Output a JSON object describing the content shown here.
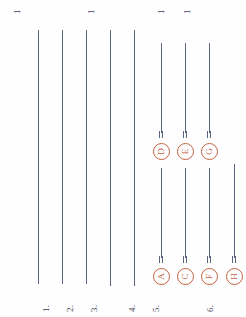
{
  "page": {
    "orientation": "rotated-90-ccw",
    "background_color": "#fefefe",
    "rule_color": "#5a6480",
    "marker_color": "#c1613f",
    "label_color": "#3d4355"
  },
  "top_digits": [
    {
      "text": "1",
      "x": 12,
      "y": 14
    },
    {
      "text": "1",
      "x": 86,
      "y": 14
    },
    {
      "text": "1",
      "x": 156,
      "y": 14
    },
    {
      "text": "1",
      "x": 182,
      "y": 14
    }
  ],
  "rules": [
    {
      "name": "rule-1",
      "x": 38,
      "top": 30,
      "bottom": 284
    },
    {
      "name": "rule-2",
      "x": 62,
      "top": 30,
      "bottom": 284
    },
    {
      "name": "rule-3",
      "x": 86,
      "top": 30,
      "bottom": 284
    },
    {
      "name": "rule-4",
      "x": 110,
      "top": 30,
      "bottom": 286
    },
    {
      "name": "rule-5",
      "x": 134,
      "top": 30,
      "bottom": 286
    },
    {
      "name": "rule-6",
      "x": 161,
      "top": 43,
      "bottom": 133
    },
    {
      "name": "rule-7",
      "x": 185,
      "top": 43,
      "bottom": 133
    },
    {
      "name": "rule-8",
      "x": 209,
      "top": 43,
      "bottom": 133
    },
    {
      "name": "rule-9",
      "x": 161,
      "top": 168,
      "bottom": 258
    },
    {
      "name": "rule-10",
      "x": 185,
      "top": 168,
      "bottom": 258
    },
    {
      "name": "rule-11",
      "x": 209,
      "top": 168,
      "bottom": 258
    },
    {
      "name": "rule-12",
      "x": 234,
      "top": 164,
      "bottom": 258
    }
  ],
  "numeric_labels": [
    {
      "text": "1.",
      "x": 41,
      "y": 312
    },
    {
      "text": "2.",
      "x": 65,
      "y": 312
    },
    {
      "text": "3.",
      "x": 89,
      "y": 312
    },
    {
      "text": "4.",
      "x": 127,
      "y": 312
    },
    {
      "text": "5.",
      "x": 151,
      "y": 312
    },
    {
      "text": "6.",
      "x": 205,
      "y": 312
    }
  ],
  "markers": [
    {
      "letter": "D",
      "x": 153,
      "y": 143,
      "tick_x": 159,
      "tick_y": 131
    },
    {
      "letter": "E",
      "x": 177,
      "y": 143,
      "tick_x": 183,
      "tick_y": 131
    },
    {
      "letter": "G",
      "x": 201,
      "y": 143,
      "tick_x": 207,
      "tick_y": 131
    },
    {
      "letter": "A",
      "x": 153,
      "y": 268,
      "tick_x": 159,
      "tick_y": 256
    },
    {
      "letter": "C",
      "x": 177,
      "y": 268,
      "tick_x": 183,
      "tick_y": 256
    },
    {
      "letter": "F",
      "x": 201,
      "y": 268,
      "tick_x": 207,
      "tick_y": 256
    },
    {
      "letter": "H",
      "x": 226,
      "y": 268,
      "tick_x": 232,
      "tick_y": 256
    }
  ]
}
